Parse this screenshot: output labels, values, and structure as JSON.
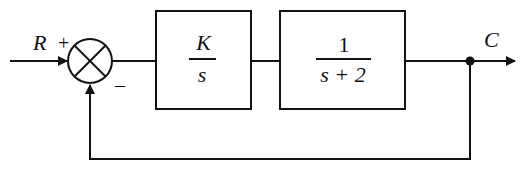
{
  "diagram": {
    "type": "feedback-control-block-diagram",
    "input": {
      "label": "R",
      "sign": "+"
    },
    "summing_junction": {
      "feedback_sign": "–"
    },
    "blocks": [
      {
        "id": "controller",
        "numerator": "K",
        "denominator": "s"
      },
      {
        "id": "plant",
        "numerator": "1",
        "denominator": "s + 2"
      }
    ],
    "output": {
      "label": "C"
    },
    "feedback": "unity negative feedback",
    "colors": {
      "stroke": "#111111",
      "background": "#ffffff"
    }
  }
}
